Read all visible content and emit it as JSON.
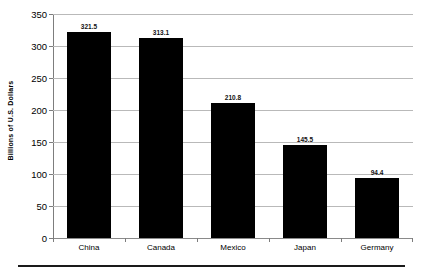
{
  "chart_data": {
    "type": "bar",
    "title": "",
    "subtitle": "",
    "xlabel": "",
    "ylabel": "Billions of  U.S.  Dollars",
    "categories": [
      "China",
      "Canada",
      "Mexico",
      "Japan",
      "Germany"
    ],
    "values": [
      321.5,
      313.1,
      210.8,
      145.5,
      94.4
    ],
    "value_labels": [
      "321.5",
      "313.1",
      "210.8",
      "145.5",
      "94.4"
    ],
    "ylim": [
      0,
      350
    ],
    "ytick_labels": [
      "350",
      "300",
      "250",
      "200",
      "150",
      "100",
      "50",
      "0"
    ],
    "ytick_values": [
      350,
      300,
      250,
      200,
      150,
      100,
      50,
      0
    ],
    "grid": true,
    "grid_axis": "y",
    "legend": false,
    "legend_position": "none",
    "bar_color": "#000000",
    "gridline_color": "#b9b9b9",
    "axis_color": "#7d7d7d",
    "background_color": "#ffffff",
    "data_labels_shown": true
  }
}
